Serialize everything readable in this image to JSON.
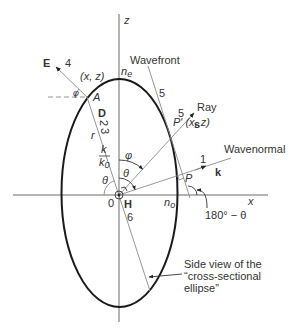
{
  "figure": {
    "axes": {
      "z_label": "z",
      "x_label": "x",
      "origin_label": "0"
    },
    "ellipse": {
      "top_label_main": "n",
      "top_label_sub": "e",
      "right_label_main": "n",
      "right_label_sub": "o",
      "caption_lines": [
        "Side view of the",
        "“cross-sectional",
        "ellipse”"
      ]
    },
    "vectors": {
      "E": {
        "label": "E",
        "number": "4"
      },
      "D": {
        "label": "D",
        "number_a": "2",
        "number_b": "3"
      },
      "H": {
        "label": "H",
        "number": "6"
      },
      "s": {
        "label": "s",
        "number": "5",
        "name": "Ray"
      },
      "k": {
        "label": "k",
        "number": "1",
        "name": "Wavenormal"
      },
      "wavefront": {
        "name": "Wavefront",
        "number": "5"
      }
    },
    "points": {
      "A": {
        "label": "A",
        "coords": "(x, z)"
      },
      "P_prime": {
        "label": "P′ (x, z)"
      },
      "P": {
        "label": "P"
      }
    },
    "angles": {
      "phi": "φ",
      "phi_small": "φ",
      "theta": "θ",
      "theta_left": "θ",
      "supplement": "180° − θ"
    },
    "radius": {
      "r": "r",
      "ratio_num": "k",
      "ratio_den_main": "k",
      "ratio_den_sub": "0"
    },
    "colors": {
      "ellipse": "#1a1a1a",
      "lines": "#8a8a8a",
      "text": "#333333"
    }
  }
}
